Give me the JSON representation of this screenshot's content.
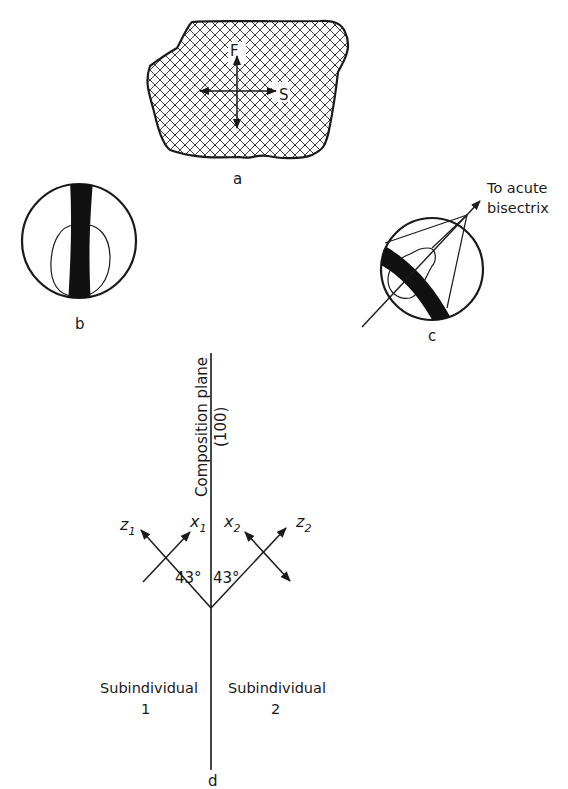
{
  "figure": {
    "panel_a": {
      "label": "a",
      "axis_fast": "F",
      "axis_slow": "S",
      "fill_pattern": "crosshatch"
    },
    "panel_b": {
      "label": "b",
      "description": "interference figure with dark vertical isogyre"
    },
    "panel_c": {
      "label": "c",
      "annotation_line1": "To acute",
      "annotation_line2": "bisectrix"
    },
    "panel_d": {
      "label": "d",
      "composition_plane_label": "Composition plane",
      "composition_plane_index": "(100)",
      "axis_z1": "z",
      "axis_z1_sub": "1",
      "axis_x1": "x",
      "axis_x1_sub": "1",
      "axis_x2": "x",
      "axis_x2_sub": "2",
      "axis_z2": "z",
      "axis_z2_sub": "2",
      "angle_left": "43°",
      "angle_right": "43°",
      "sub1_line1": "Subindividual",
      "sub1_line2": "1",
      "sub2_line1": "Subindividual",
      "sub2_line2": "2"
    },
    "colors": {
      "ink": "#1a1a1a",
      "background": "#ffffff"
    }
  }
}
